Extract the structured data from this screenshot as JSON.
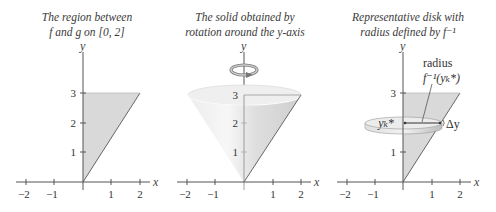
{
  "panels": [
    {
      "title_line1": "The region between",
      "title_line2": "f and g on [0, 2]",
      "axis_x_label": "x",
      "axis_y_label": "y",
      "x_ticks": [
        "−2",
        "−1",
        "1",
        "2"
      ],
      "y_ticks": [
        "1",
        "2",
        "3"
      ]
    },
    {
      "title_line1": "The solid obtained by",
      "title_line2": "rotation around the y-axis",
      "axis_x_label": "x",
      "axis_y_label": "y",
      "x_ticks": [
        "−2",
        "−1",
        "1",
        "2"
      ],
      "y_ticks": [
        "1",
        "2",
        "3"
      ]
    },
    {
      "title_line1": "Representative disk with",
      "title_line2": "radius defined by f⁻¹",
      "axis_x_label": "x",
      "axis_y_label": "y",
      "x_ticks": [
        "−2",
        "−1",
        "1",
        "2"
      ],
      "y_ticks": [
        "1",
        "3"
      ],
      "annotations": {
        "radius_label": "radius",
        "radius_formula": "f⁻¹(yₖ*)",
        "disk_height_label": "yₖ*",
        "delta_y_label": "Δy"
      }
    }
  ],
  "colors": {
    "region_fill": "#d9d9d9",
    "axis": "#555555",
    "line": "#666666",
    "cone_fill": "#e4e4e4",
    "disk_fill": "#e6e6e6"
  }
}
